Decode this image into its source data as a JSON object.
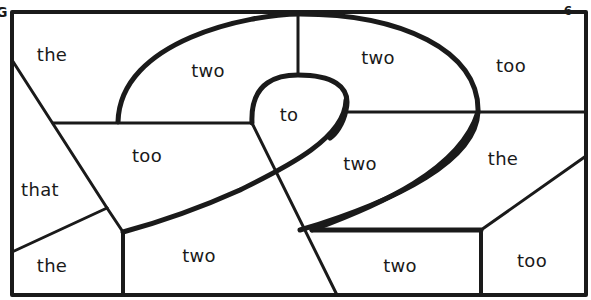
{
  "page": {
    "corner_letter": "G",
    "page_number": "-6-"
  },
  "regions": [
    {
      "id": "r1",
      "word": "the",
      "x": 52,
      "y": 54
    },
    {
      "id": "r2",
      "word": "two",
      "x": 208,
      "y": 70
    },
    {
      "id": "r3",
      "word": "two",
      "x": 378,
      "y": 57
    },
    {
      "id": "r4",
      "word": "too",
      "x": 511,
      "y": 65
    },
    {
      "id": "r5",
      "word": "to",
      "x": 289,
      "y": 114
    },
    {
      "id": "r6",
      "word": "too",
      "x": 147,
      "y": 155
    },
    {
      "id": "r7",
      "word": "two",
      "x": 360,
      "y": 163
    },
    {
      "id": "r8",
      "word": "the",
      "x": 503,
      "y": 158
    },
    {
      "id": "r9",
      "word": "that",
      "x": 40,
      "y": 189
    },
    {
      "id": "r10",
      "word": "the",
      "x": 52,
      "y": 265
    },
    {
      "id": "r11",
      "word": "two",
      "x": 199,
      "y": 255
    },
    {
      "id": "r12",
      "word": "two",
      "x": 400,
      "y": 265
    },
    {
      "id": "r13",
      "word": "too",
      "x": 532,
      "y": 260
    }
  ],
  "colors": {
    "line": "#1a1a1a",
    "background": "#ffffff"
  }
}
